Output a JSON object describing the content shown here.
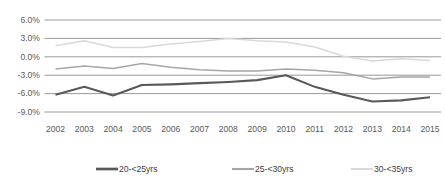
{
  "chart_data": {
    "type": "line",
    "title": "",
    "subtitle": "",
    "xlabel": "",
    "ylabel": "",
    "categories": [
      "2002",
      "2003",
      "2004",
      "2005",
      "2006",
      "2007",
      "2008",
      "2009",
      "2010",
      "2011",
      "2012",
      "2013",
      "2014",
      "2015"
    ],
    "ytick_labels": [
      "6.0%",
      "3.0%",
      "0.0%",
      "-3.0%",
      "-6.0%",
      "-9.0%"
    ],
    "ytick_values": [
      6.0,
      3.0,
      0.0,
      -3.0,
      -6.0,
      -9.0
    ],
    "ylim": [
      -9.0,
      6.0
    ],
    "grid": "horizontal",
    "legend_position": "bottom",
    "series": [
      {
        "name": "20-<25yrs",
        "color": "#595959",
        "stroke_width": 2.1,
        "values": [
          -6.2,
          -4.9,
          -6.3,
          -4.6,
          -4.5,
          -4.3,
          -4.1,
          -3.8,
          -3.0,
          -4.9,
          -6.2,
          -7.3,
          -7.1,
          -6.6
        ]
      },
      {
        "name": "25-<30yrs",
        "color": "#a6a6a6",
        "stroke_width": 1.5,
        "values": [
          -2.0,
          -1.5,
          -1.9,
          -1.1,
          -1.7,
          -2.1,
          -2.3,
          -2.3,
          -2.0,
          -2.2,
          -2.6,
          -3.6,
          -3.3,
          -3.3
        ]
      },
      {
        "name": "30-<35yrs",
        "color": "#d9d9d9",
        "stroke_width": 1.5,
        "values": [
          1.8,
          2.6,
          1.5,
          1.5,
          2.1,
          2.5,
          3.0,
          2.6,
          2.4,
          1.6,
          0.1,
          -0.7,
          -0.3,
          -0.6
        ]
      }
    ]
  },
  "legend": {
    "items": [
      {
        "label": "20-<25yrs"
      },
      {
        "label": "25-<30yrs"
      },
      {
        "label": "30-<35yrs"
      }
    ]
  }
}
